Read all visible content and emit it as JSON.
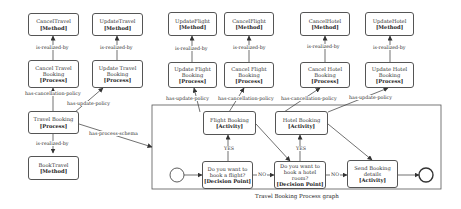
{
  "diagram": {
    "caption": "Travel Booking Process graph",
    "nodes": {
      "cancel_travel_method": {
        "name": "CancelTravel",
        "type": "[Method]"
      },
      "update_travel_method": {
        "name": "UpdateTravel",
        "type": "[Method]"
      },
      "cancel_travel_process": {
        "name": "Cancel Travel Booking",
        "type": "[Process]"
      },
      "update_travel_process": {
        "name": "Update Travel Booking",
        "type": "[Process]"
      },
      "travel_booking_process": {
        "name": "Travel Booking",
        "type": "[Process]"
      },
      "book_travel_method": {
        "name": "BookTravel",
        "type": "[Method]"
      },
      "update_flight_method": {
        "name": "UpdateFlight",
        "type": "[Method]"
      },
      "cancel_flight_method": {
        "name": "CancelFlight",
        "type": "[Method]"
      },
      "update_flight_process": {
        "name": "Update Flight Booking",
        "type": "[Process]"
      },
      "cancel_flight_process": {
        "name": "Cancel Flight Booking",
        "type": "[Process]"
      },
      "cancel_hotel_method": {
        "name": "CancelHotel",
        "type": "[Method]"
      },
      "update_hotel_method": {
        "name": "UpdateHotel",
        "type": "[Method]"
      },
      "cancel_hotel_process": {
        "name": "Cancel Hotel Booking",
        "type": "[Process]"
      },
      "update_hotel_process": {
        "name": "Update Hotel Booking",
        "type": "[Process]"
      },
      "flight_booking_activity": {
        "name": "Flight Booking",
        "type": "[Activity]"
      },
      "hotel_booking_activity": {
        "name": "Hotel Booking",
        "type": "[Activity]"
      },
      "decision_flight": {
        "name": "Do you want to book a flight?",
        "type": "[Decision Point]"
      },
      "decision_hotel": {
        "name": "Do you want to book a hotel room?",
        "type": "[Decision Point]"
      },
      "send_booking_activity": {
        "name": "Send Booking details",
        "type": "[Activity]"
      }
    },
    "edge_labels": {
      "is_realized_by": "is-realized-by",
      "has_cancellation_policy": "has-cancellation-policy",
      "has_update_policy": "has-update-policy",
      "has_process_schema": "has-process-schema",
      "yes": "YES",
      "no": "NO"
    }
  }
}
